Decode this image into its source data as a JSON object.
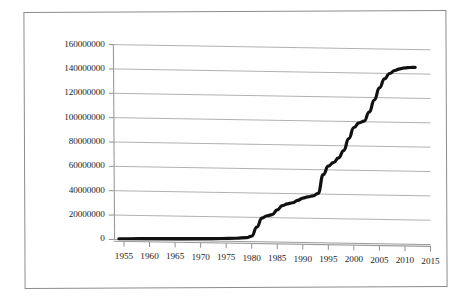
{
  "chart_data": {
    "type": "line",
    "title": "",
    "subtitle": "",
    "xlabel": "",
    "ylabel": "",
    "xlim": [
      1953,
      2015
    ],
    "ylim": [
      0,
      160000000
    ],
    "grid": true,
    "legend": null,
    "x_tick_labels": [
      "1955",
      "1960",
      "1965",
      "1970",
      "1975",
      "1980",
      "1985",
      "1990",
      "1995",
      "2000",
      "2005",
      "2010",
      "2015"
    ],
    "y_tick_labels": [
      "0",
      "20000000",
      "40000000",
      "60000000",
      "80000000",
      "100000000",
      "120000000",
      "140000000",
      "160000000"
    ],
    "x_ticks": [
      1955,
      1960,
      1965,
      1970,
      1975,
      1980,
      1985,
      1990,
      1995,
      2000,
      2005,
      2010,
      2015
    ],
    "y_ticks": [
      0,
      20000000,
      40000000,
      60000000,
      80000000,
      100000000,
      120000000,
      140000000,
      160000000
    ],
    "series": [
      {
        "name": "cumulative total",
        "color": "#111111",
        "line_width": 3.2,
        "x": [
          1954,
          1958,
          1962,
          1966,
          1970,
          1974,
          1977,
          1979,
          1980,
          1981,
          1982,
          1983,
          1984,
          1985,
          1986,
          1987,
          1988,
          1989,
          1990,
          1991,
          1992,
          1993,
          1994,
          1995,
          1996,
          1997,
          1998,
          1999,
          2000,
          2001,
          2002,
          2003,
          2004,
          2005,
          2006,
          2007,
          2008,
          2009,
          2010,
          2011,
          2012
        ],
        "y": [
          600000,
          900000,
          1200000,
          1500000,
          1800000,
          2200000,
          2600000,
          3200000,
          4500000,
          12000000,
          19500000,
          21500000,
          22500000,
          26500000,
          30000000,
          31500000,
          32500000,
          34500000,
          36500000,
          37500000,
          38500000,
          40500000,
          56000000,
          63000000,
          66000000,
          70000000,
          76000000,
          86000000,
          95000000,
          99000000,
          100500000,
          108000000,
          118000000,
          128000000,
          135500000,
          140000000,
          142500000,
          144000000,
          144800000,
          145200000,
          145400000
        ]
      }
    ]
  },
  "axes": {
    "y_axis_name": "y-axis",
    "x_axis_name": "x-axis"
  }
}
